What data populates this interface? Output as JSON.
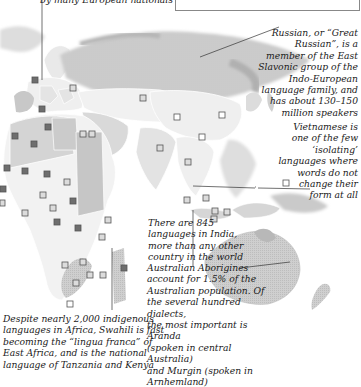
{
  "top_caption": "by many European nationals",
  "notes": {
    "russian": [
      "Russian, or “Great",
      "Russian”, is a",
      "member of the East",
      "Slavonic group of the",
      "Indo-European",
      "language family, and",
      "has about 130–150",
      "million speakers"
    ],
    "vietnamese": [
      "Vietnamese is",
      "one of the few",
      "‘isolating’",
      "languages where",
      "words do not",
      "change their",
      "form at all"
    ],
    "india": [
      "There are 845",
      "languages in India,",
      "more than any other",
      "country in the world"
    ],
    "swahili": [
      "Despite nearly 2,000 indigenous",
      "languages in Africa, Swahili is fast",
      "becoming the “lingua franca” of",
      "East Africa, and is the national",
      "language of Tanzania and Kenya"
    ],
    "australia": [
      "Australian Aborigines",
      "account for 1.5% of the",
      "Australian population. Of",
      "the several hundred dialects,",
      "the most important is Aranda",
      "(spoken in central Australia)",
      "and Murgin (spoken in",
      "Arnhemland)"
    ]
  },
  "colors": {
    "land_light": "#eeeeee",
    "land_mid": "#d2d2d2",
    "land_dark": "#b4b4b4",
    "border": "#ffffff",
    "marker_dark": "#6e6e6e",
    "marker_light": "#dcdcdc",
    "marker_white": "#ffffff"
  }
}
